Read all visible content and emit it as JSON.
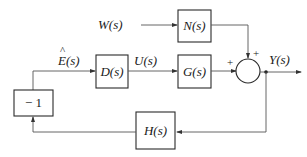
{
  "blocks": {
    "D": "D(s)",
    "G": "G(s)",
    "N": "N(s)",
    "H": "H(s)",
    "neg": "− 1"
  },
  "signals": {
    "W": "W(s)",
    "E": "E(s)",
    "E_hat": "^",
    "U": "U(s)",
    "Y": "Y(s)"
  },
  "summing_junction": {
    "left_sign": "+",
    "top_sign": "+"
  }
}
